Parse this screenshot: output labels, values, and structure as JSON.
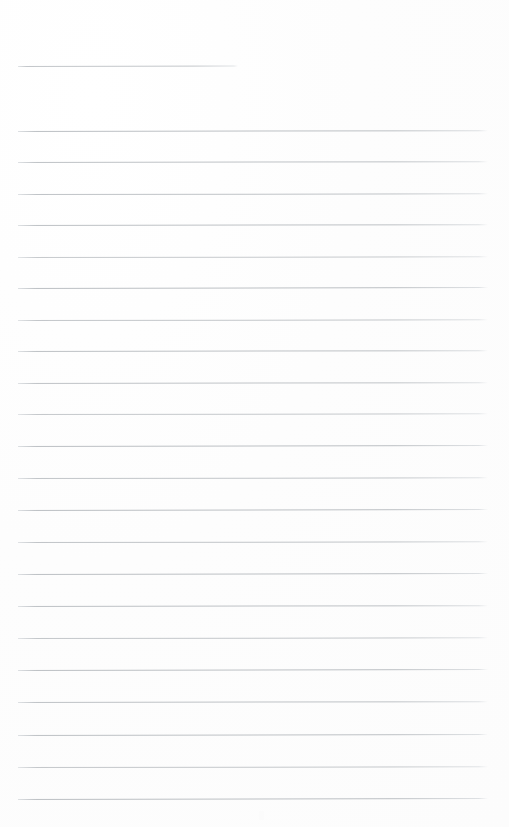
{
  "document": {
    "kind": "scanned-ruled-notepaper",
    "page_width": 509,
    "page_height": 827,
    "background_color": "#fefefe",
    "paper_tone": "#fdfdfd",
    "ink_color": "#b9bdc1",
    "ink_color_faded": "#dcdfe2",
    "content_text": "",
    "title_line_label": "",
    "body_text_lines": []
  },
  "ruling": {
    "left_margin_px": 18,
    "right_edge_px": 488,
    "full_line_width_px": 470,
    "line_spacing_px": 31.6,
    "line_thickness_px": 1,
    "total_rules": 23,
    "short_rules": 1,
    "full_rules": 22
  },
  "lines": [
    {
      "index": 1,
      "type": "title-rule",
      "x": 18,
      "y": 66,
      "width": 220,
      "opacity": 0.85,
      "tilt_deg": -0.12
    },
    {
      "index": 2,
      "type": "body-rule",
      "x": 18,
      "y": 131,
      "width": 470,
      "opacity": 0.95,
      "tilt_deg": -0.1
    },
    {
      "index": 3,
      "type": "body-rule",
      "x": 18,
      "y": 162,
      "width": 470,
      "opacity": 0.92,
      "tilt_deg": -0.1
    },
    {
      "index": 4,
      "type": "body-rule",
      "x": 18,
      "y": 194,
      "width": 470,
      "opacity": 0.9,
      "tilt_deg": -0.08
    },
    {
      "index": 5,
      "type": "body-rule",
      "x": 18,
      "y": 225,
      "width": 470,
      "opacity": 0.93,
      "tilt_deg": -0.1
    },
    {
      "index": 6,
      "type": "body-rule",
      "x": 18,
      "y": 257,
      "width": 470,
      "opacity": 0.8,
      "tilt_deg": -0.09
    },
    {
      "index": 7,
      "type": "body-rule",
      "x": 18,
      "y": 288,
      "width": 470,
      "opacity": 0.95,
      "tilt_deg": -0.11
    },
    {
      "index": 8,
      "type": "body-rule",
      "x": 18,
      "y": 320,
      "width": 470,
      "opacity": 0.85,
      "tilt_deg": -0.09
    },
    {
      "index": 9,
      "type": "body-rule",
      "x": 18,
      "y": 351,
      "width": 470,
      "opacity": 0.93,
      "tilt_deg": -0.1
    },
    {
      "index": 10,
      "type": "body-rule",
      "x": 18,
      "y": 383,
      "width": 470,
      "opacity": 0.9,
      "tilt_deg": -0.1
    },
    {
      "index": 11,
      "type": "body-rule",
      "x": 18,
      "y": 414,
      "width": 470,
      "opacity": 0.82,
      "tilt_deg": -0.08
    },
    {
      "index": 12,
      "type": "body-rule",
      "x": 18,
      "y": 446,
      "width": 470,
      "opacity": 0.95,
      "tilt_deg": -0.11
    },
    {
      "index": 13,
      "type": "body-rule",
      "x": 18,
      "y": 478,
      "width": 470,
      "opacity": 0.86,
      "tilt_deg": -0.09
    },
    {
      "index": 14,
      "type": "body-rule",
      "x": 18,
      "y": 510,
      "width": 470,
      "opacity": 0.95,
      "tilt_deg": -0.11
    },
    {
      "index": 15,
      "type": "body-rule",
      "x": 18,
      "y": 542,
      "width": 470,
      "opacity": 0.88,
      "tilt_deg": -0.09
    },
    {
      "index": 16,
      "type": "body-rule",
      "x": 18,
      "y": 574,
      "width": 470,
      "opacity": 0.95,
      "tilt_deg": -0.11
    },
    {
      "index": 17,
      "type": "body-rule",
      "x": 18,
      "y": 606,
      "width": 470,
      "opacity": 0.93,
      "tilt_deg": -0.1
    },
    {
      "index": 18,
      "type": "body-rule",
      "x": 18,
      "y": 638,
      "width": 470,
      "opacity": 0.84,
      "tilt_deg": -0.09
    },
    {
      "index": 19,
      "type": "body-rule",
      "x": 18,
      "y": 670,
      "width": 470,
      "opacity": 0.95,
      "tilt_deg": -0.11
    },
    {
      "index": 20,
      "type": "body-rule",
      "x": 18,
      "y": 702,
      "width": 470,
      "opacity": 0.92,
      "tilt_deg": -0.1
    },
    {
      "index": 21,
      "type": "body-rule",
      "x": 18,
      "y": 735,
      "width": 470,
      "opacity": 0.93,
      "tilt_deg": -0.11
    },
    {
      "index": 22,
      "type": "body-rule",
      "x": 18,
      "y": 767,
      "width": 470,
      "opacity": 0.83,
      "tilt_deg": -0.09
    },
    {
      "index": 23,
      "type": "body-rule",
      "x": 18,
      "y": 799,
      "width": 470,
      "opacity": 0.95,
      "tilt_deg": -0.11
    }
  ],
  "artifact": {
    "present": true,
    "x": 259,
    "y": 811,
    "width": 5,
    "height": 9,
    "color": "#fbfbfb"
  }
}
